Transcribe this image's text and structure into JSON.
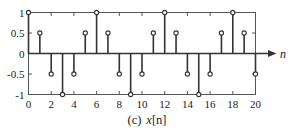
{
  "caption": {
    "index": "(c)",
    "signal_name": "x",
    "signal_index": "[n]",
    "full": "(c) x[n]"
  },
  "axes": {
    "x_label": "n",
    "y_label": "",
    "x_ticks": [
      0,
      2,
      4,
      6,
      8,
      10,
      12,
      14,
      16,
      18,
      20
    ],
    "x_tick_labels": [
      "0",
      "2",
      "4",
      "6",
      "8",
      "10",
      "12",
      "14",
      "16",
      "18",
      "20"
    ],
    "y_ticks": [
      1,
      0.5,
      0,
      -0.5,
      -1
    ],
    "y_tick_labels": [
      "1",
      "0.5",
      "0",
      "-0.5",
      "-1"
    ],
    "xlim": [
      0,
      20
    ],
    "ylim": [
      -1,
      1
    ],
    "x_arrow": true,
    "frame": true,
    "grid": false
  },
  "style": {
    "stem_color": "#333333",
    "marker_face": "#ffffff",
    "marker_edge": "#333333",
    "axis_color": "#555555",
    "baseline_color": "#333333",
    "text_color": "#1a1a1a",
    "background": "#ffffff"
  },
  "chart_data": {
    "type": "line",
    "plot_style": "stem",
    "xlabel": "n",
    "ylabel": "",
    "xlim": [
      0,
      20
    ],
    "ylim": [
      -1,
      1
    ],
    "grid": false,
    "legend": null,
    "x": [
      0,
      1,
      2,
      3,
      4,
      5,
      6,
      7,
      8,
      9,
      10,
      11,
      12,
      13,
      14,
      15,
      16,
      17,
      18,
      19,
      20
    ],
    "values": [
      1,
      0.5,
      -0.5,
      -1,
      -0.5,
      0.5,
      1,
      0.5,
      -0.5,
      -1,
      -0.5,
      0.5,
      1,
      0.5,
      -0.5,
      -1,
      -0.5,
      0.5,
      1,
      0.5,
      -0.5
    ],
    "series": [
      {
        "name": "x[n]",
        "values": [
          1,
          0.5,
          -0.5,
          -1,
          -0.5,
          0.5,
          1,
          0.5,
          -0.5,
          -1,
          -0.5,
          0.5,
          1,
          0.5,
          -0.5,
          -1,
          -0.5,
          0.5,
          1,
          0.5,
          -0.5
        ]
      }
    ],
    "annotations": []
  }
}
